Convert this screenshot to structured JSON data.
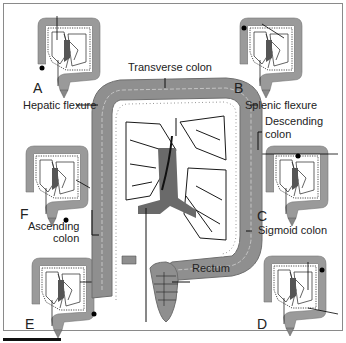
{
  "figure": {
    "type": "anatomical-diagram",
    "colors": {
      "colon_fill": "#8f8f8f",
      "colon_light": "#b5b5b5",
      "line": "#1a1a1a",
      "border": "#8a8a8a",
      "background": "#ffffff"
    }
  },
  "labels": {
    "transverse_colon": "Transverse colon",
    "hepatic_flexure": "Hepatic flexure",
    "splenic_flexure": "Splenic flexure",
    "descending_colon_l1": "Descending",
    "descending_colon_l2": "colon",
    "ascending_colon_l1": "Ascending",
    "ascending_colon_l2": "colon",
    "sigmoid_colon": "Sigmoid colon",
    "rectum": "Rectum"
  },
  "insets": [
    {
      "letter": "A",
      "position": "top-left",
      "marker": "ascending colon (lower right side)"
    },
    {
      "letter": "B",
      "position": "top-right",
      "marker": "hepatic flexure"
    },
    {
      "letter": "C",
      "position": "middle-right",
      "marker": "transverse colon"
    },
    {
      "letter": "D",
      "position": "bottom-right",
      "marker": "splenic flexure"
    },
    {
      "letter": "E",
      "position": "bottom-left",
      "marker": "descending / sigmoid colon"
    },
    {
      "letter": "F",
      "position": "middle-left",
      "marker": "rectum"
    }
  ]
}
